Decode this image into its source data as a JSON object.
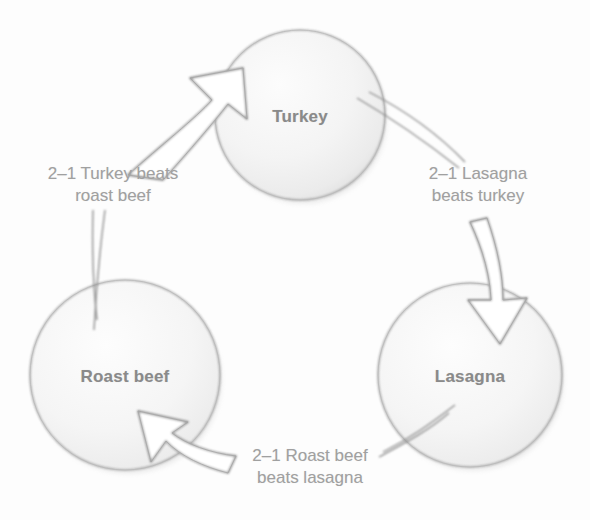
{
  "diagram": {
    "type": "cycle",
    "title": "",
    "background_color": "#fdfdfd",
    "node_text_color": "#8a8a8a",
    "edge_text_color": "#a0a0a0",
    "outline_color": "#9a9a9a",
    "nodes": [
      {
        "id": "turkey",
        "label": "Turkey",
        "cx": 300,
        "cy": 115,
        "r": 85
      },
      {
        "id": "roast-beef",
        "label": "Roast beef",
        "cx": 125,
        "cy": 375,
        "r": 95
      },
      {
        "id": "lasagna",
        "label": "Lasagna",
        "cx": 470,
        "cy": 375,
        "r": 92
      }
    ],
    "edges": [
      {
        "id": "turkey-beats-roast-beef",
        "from": "roast-beef",
        "to": "turkey",
        "label_line1": "2–1 Turkey beats",
        "label_line2": "roast beef",
        "label_x": 113,
        "label_y": 185
      },
      {
        "id": "lasagna-beats-turkey",
        "from": "turkey",
        "to": "lasagna",
        "label_line1": "2–1 Lasagna",
        "label_line2": "beats turkey",
        "label_x": 478,
        "label_y": 185
      },
      {
        "id": "roast-beef-beats-lasagna",
        "from": "lasagna",
        "to": "roast-beef",
        "label_line1": "2–1 Roast beef",
        "label_line2": "beats lasagna",
        "label_x": 310,
        "label_y": 467
      }
    ]
  }
}
